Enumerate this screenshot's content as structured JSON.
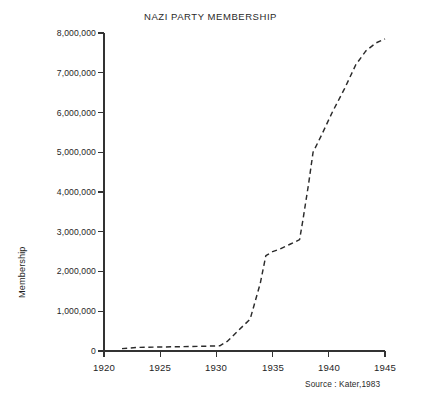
{
  "chart_data": {
    "type": "line",
    "title": "NAZI PARTY MEMBERSHIP",
    "xlabel": "",
    "ylabel": "Membership",
    "source": "Source : Kater,1983",
    "xlim": [
      1920,
      1945
    ],
    "ylim": [
      0,
      8000000
    ],
    "grid": false,
    "legend": "none",
    "line_style": "dashed",
    "line_color": "#2b2b2b",
    "xticks": [
      1920,
      1925,
      1930,
      1935,
      1940,
      1945
    ],
    "xtick_labels": [
      "1920",
      "1925",
      "1930",
      "1935",
      "1940",
      "1945"
    ],
    "yticks": [
      0,
      1000000,
      2000000,
      3000000,
      4000000,
      5000000,
      6000000,
      7000000,
      8000000
    ],
    "ytick_labels": [
      "0",
      "1,000,000",
      "2,000,000",
      "3,000,000",
      "4,000,000",
      "5,000,000",
      "6,000,000",
      "7,000,000",
      "8,000,000"
    ],
    "series": [
      {
        "name": "Membership",
        "x": [
          1921.6,
          1923.0,
          1925.0,
          1927.0,
          1929.0,
          1930.3,
          1931.0,
          1932.0,
          1933.0,
          1933.9,
          1934.4,
          1935.0,
          1935.6,
          1936.5,
          1937.4,
          1937.7,
          1938.2,
          1938.6,
          1939.3,
          1940.3,
          1941.4,
          1942.4,
          1943.3,
          1944.2,
          1945.0
        ],
        "y": [
          60000,
          90000,
          100000,
          110000,
          120000,
          130000,
          250000,
          530000,
          800000,
          1700000,
          2400000,
          2500000,
          2560000,
          2680000,
          2800000,
          3300000,
          4200000,
          5000000,
          5400000,
          6000000,
          6600000,
          7200000,
          7550000,
          7750000,
          7850000
        ]
      }
    ]
  }
}
